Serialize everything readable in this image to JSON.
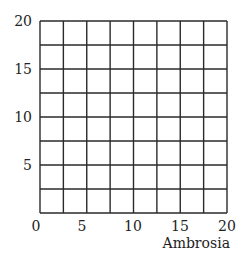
{
  "chart_data": {
    "type": "scatter",
    "title": "",
    "xlabel": "Ambrosia",
    "ylabel": "",
    "xlim": [
      0,
      20
    ],
    "ylim": [
      0,
      20
    ],
    "grid": true,
    "grid_divisions": {
      "x": 8,
      "y": 8
    },
    "x_ticks": [
      {
        "label": "0",
        "px": 36
      },
      {
        "label": "5",
        "px": 82
      },
      {
        "label": "10",
        "px": 133
      },
      {
        "label": "15",
        "px": 180
      },
      {
        "label": "20",
        "px": 227
      }
    ],
    "y_ticks": [
      {
        "label": "20",
        "py": 21
      },
      {
        "label": "15",
        "py": 69
      },
      {
        "label": "10",
        "py": 117
      },
      {
        "label": "5",
        "py": 165
      }
    ],
    "series": [],
    "legend": null
  },
  "colors": {
    "grid_line": "#2a2a2a",
    "text": "#222222",
    "background": "#ffffff"
  },
  "plot_area": {
    "left": 40,
    "top": 21,
    "right": 227,
    "bottom": 213
  }
}
